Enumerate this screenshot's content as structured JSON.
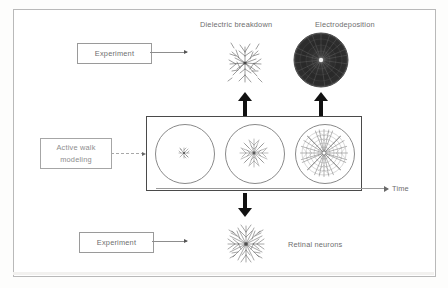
{
  "figure": {
    "title_present": false,
    "background": "#ffffff",
    "border_color": "#b9b9b9"
  },
  "labels": {
    "dielectric_breakdown": "Dielectric breakdown",
    "electrodeposition": "Electrodeposition",
    "retinal_neurons": "Retinal neurons",
    "time_axis": "Time"
  },
  "boxes": {
    "experiment_top": "Experiment",
    "experiment_bottom": "Experiment",
    "model_line1": "Active walk",
    "model_line2": "modeling"
  },
  "simulation": {
    "stages": [
      {
        "name": "stage-early",
        "density": "sparse",
        "cluster_radius_ratio": 0.14
      },
      {
        "name": "stage-middle",
        "density": "medium",
        "cluster_radius_ratio": 0.38
      },
      {
        "name": "stage-late",
        "density": "dense",
        "cluster_radius_ratio": 0.86
      }
    ]
  },
  "icons": {
    "dielectric": "lichtenberg-fractal-icon",
    "electrodeposition": "dense-radial-disc-icon",
    "neuron": "dendritic-tree-icon",
    "arrow_up": "bold-up-arrow-icon",
    "arrow_down": "bold-down-arrow-icon",
    "time_arrow": "time-axis-arrow-icon"
  },
  "colors": {
    "text": "#6e6e6e",
    "panel_border": "#4a4a4a",
    "arrow_black": "#111111",
    "circle_stroke": "#8a8a8a"
  }
}
